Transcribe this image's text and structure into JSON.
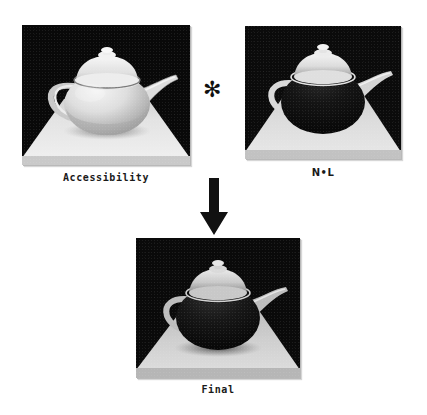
{
  "figure": {
    "background_color": "#ffffff",
    "ink_color": "#111111"
  },
  "panels": [
    {
      "id": "accessibility",
      "caption": "Accessibility",
      "icon": "teapot-render-icon",
      "x": 22,
      "y": 25,
      "w": 168,
      "h": 140,
      "backdrop_color": "#0a0a0a",
      "floor_color": "#e2e2e2",
      "teapot_body_color": "#dcdcdc",
      "teapot_shading": "light",
      "caption_x": 22,
      "caption_y": 172,
      "caption_w": 168
    },
    {
      "id": "n-dot-l",
      "caption": "N•L",
      "icon": "teapot-render-icon",
      "x": 245,
      "y": 26,
      "w": 156,
      "h": 133,
      "backdrop_color": "#0b0b0b",
      "floor_color": "#d8d8d8",
      "teapot_body_color": "#121212",
      "teapot_shading": "dark",
      "caption_x": 245,
      "caption_y": 167,
      "caption_w": 156
    },
    {
      "id": "final",
      "caption": "Final",
      "icon": "teapot-render-icon",
      "x": 136,
      "y": 238,
      "w": 164,
      "h": 140,
      "backdrop_color": "#0a0a0a",
      "floor_color": "#cfcfcf",
      "teapot_body_color": "#161616",
      "teapot_shading": "dark",
      "caption_x": 136,
      "caption_y": 384,
      "caption_w": 164
    }
  ],
  "operator": {
    "symbol": "✻",
    "name": "multiply-operator",
    "x": 203,
    "y": 79
  },
  "arrow": {
    "name": "down-arrow",
    "direction": "down",
    "color": "#111111",
    "x": 198,
    "y": 178,
    "w": 32,
    "h": 58
  }
}
